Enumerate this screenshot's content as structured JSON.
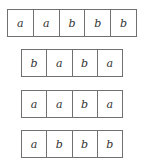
{
  "diagram": {
    "rows": [
      {
        "cells": [
          "a",
          "a",
          "b",
          "b",
          "b"
        ]
      },
      {
        "cells": [
          "b",
          "a",
          "b",
          "a"
        ]
      },
      {
        "cells": [
          "a",
          "a",
          "b",
          "a"
        ]
      },
      {
        "cells": [
          "a",
          "b",
          "b",
          "b"
        ]
      }
    ],
    "colors": {
      "border": "#707070",
      "text": "#333333",
      "background": "#ffffff"
    }
  }
}
